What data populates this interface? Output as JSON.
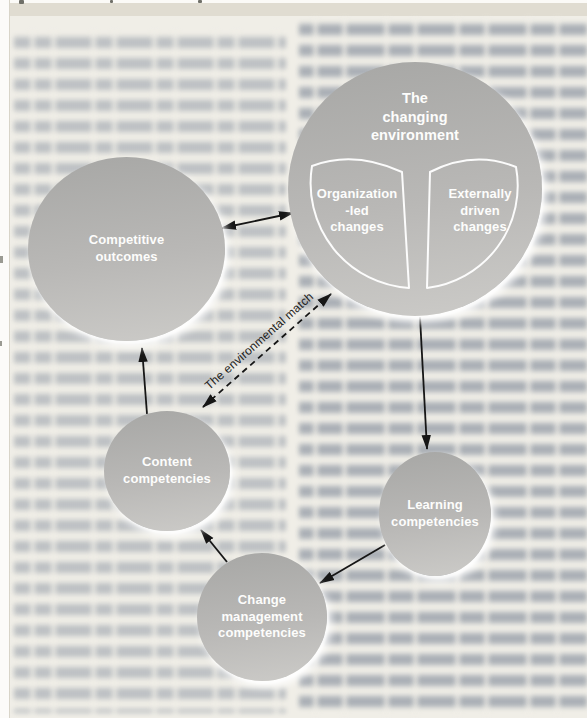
{
  "figure": {
    "nodes": {
      "changing_environment": {
        "l1": "The",
        "l2": "changing",
        "l3": "environment"
      },
      "organization_led": {
        "l1": "Organization",
        "l2": "-led",
        "l3": "changes"
      },
      "externally_driven": {
        "l1": "Externally",
        "l2": "driven",
        "l3": "changes"
      },
      "competitive_outcomes": {
        "l1": "Competitive",
        "l2": "outcomes"
      },
      "content_competencies": {
        "l1": "Content",
        "l2": "competencies"
      },
      "learning_competencies": {
        "l1": "Learning",
        "l2": "competencies"
      },
      "change_management": {
        "l1": "Change",
        "l2": "management",
        "l3": "competencies"
      }
    },
    "annotations": {
      "environmental_match": "The environmental match"
    },
    "edges": [
      {
        "from": "competitive_outcomes",
        "to": "changing_environment",
        "style": "solid",
        "heads": "both"
      },
      {
        "from": "content_competencies",
        "to": "competitive_outcomes",
        "style": "solid",
        "heads": "end"
      },
      {
        "from": "changing_environment",
        "to": "learning_competencies",
        "style": "solid",
        "heads": "end"
      },
      {
        "from": "learning_competencies",
        "to": "change_management",
        "style": "solid",
        "heads": "end"
      },
      {
        "from": "change_management",
        "to": "content_competencies",
        "style": "solid",
        "heads": "end"
      },
      {
        "from": "changing_environment",
        "to": "content_competencies",
        "style": "dashed",
        "heads": "both",
        "label": "The environmental match"
      }
    ],
    "colors": {
      "circle_fill_top": "#a7a7a5",
      "circle_fill_bottom": "#cccbc8",
      "circle_text": "#fdfdfc",
      "petal_outline": "#ffffff",
      "arrow": "#161616",
      "annotation_text": "#1d1d1b",
      "page_background": "#f0eee7",
      "top_band": "#e0dcd1",
      "blurred_text": "#808a99"
    }
  }
}
